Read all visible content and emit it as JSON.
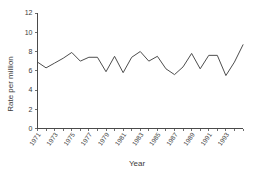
{
  "chart_data": {
    "type": "line",
    "title": "",
    "xlabel": "Year",
    "ylabel": "Rate per million",
    "xlim": [
      1971,
      1995
    ],
    "ylim": [
      0,
      12
    ],
    "grid": false,
    "legend": false,
    "y_ticks": [
      0,
      2,
      4,
      6,
      8,
      10,
      12
    ],
    "x_tick_labels": [
      "1971",
      "1973",
      "1975",
      "1977",
      "1979",
      "1981",
      "1983",
      "1985",
      "1987",
      "1989",
      "1991",
      "1993"
    ],
    "x": [
      1971,
      1972,
      1973,
      1974,
      1975,
      1976,
      1977,
      1978,
      1979,
      1980,
      1981,
      1982,
      1983,
      1984,
      1985,
      1986,
      1987,
      1988,
      1989,
      1990,
      1991,
      1992,
      1993,
      1994,
      1995
    ],
    "categories": [
      "1971",
      "1972",
      "1973",
      "1974",
      "1975",
      "1976",
      "1977",
      "1978",
      "1979",
      "1980",
      "1981",
      "1982",
      "1983",
      "1984",
      "1985",
      "1986",
      "1987",
      "1988",
      "1989",
      "1990",
      "1991",
      "1992",
      "1993",
      "1994",
      "1995"
    ],
    "values": [
      6.9,
      6.3,
      6.8,
      7.3,
      7.9,
      7.0,
      7.4,
      7.4,
      5.9,
      7.5,
      5.8,
      7.4,
      8.0,
      7.0,
      7.5,
      6.2,
      5.6,
      6.4,
      7.8,
      6.2,
      7.6,
      7.6,
      5.5,
      6.9,
      8.7
    ],
    "series": [
      {
        "name": "Rate per million",
        "color": "#4d4d4d",
        "values": [
          6.9,
          6.3,
          6.8,
          7.3,
          7.9,
          7.0,
          7.4,
          7.4,
          5.9,
          7.5,
          5.8,
          7.4,
          8.0,
          7.0,
          7.5,
          6.2,
          5.6,
          6.4,
          7.8,
          6.2,
          7.6,
          7.6,
          5.5,
          6.9,
          8.7
        ]
      }
    ]
  },
  "axis": {
    "y_label": "Rate per million",
    "x_label": "Year"
  }
}
